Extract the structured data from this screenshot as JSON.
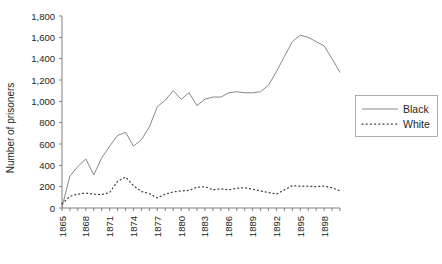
{
  "chart_data": {
    "type": "line",
    "title": "",
    "xlabel": "",
    "ylabel": "Number of prisoners",
    "ylim": [
      0,
      1800
    ],
    "ytick_step": 200,
    "ytick_labels": [
      "1,800",
      "1,600",
      "1,400",
      "1,200",
      "1,000",
      "800",
      "600",
      "400",
      "200",
      "0"
    ],
    "xlim": [
      1865,
      1900
    ],
    "xtick_labels": [
      "1865",
      "1868",
      "1871",
      "1874",
      "1877",
      "1880",
      "1883",
      "1886",
      "1889",
      "1892",
      "1895",
      "1898"
    ],
    "xtick_step": 3,
    "grid": false,
    "legend_position": "right-middle",
    "x": [
      1865,
      1866,
      1867,
      1868,
      1869,
      1870,
      1871,
      1872,
      1873,
      1874,
      1875,
      1876,
      1877,
      1878,
      1879,
      1880,
      1881,
      1882,
      1883,
      1884,
      1885,
      1886,
      1887,
      1888,
      1889,
      1890,
      1891,
      1892,
      1893,
      1894,
      1895,
      1896,
      1897,
      1898,
      1899,
      1900
    ],
    "series": [
      {
        "name": "Black",
        "style": "solid",
        "values": [
          10,
          300,
          390,
          460,
          310,
          470,
          580,
          680,
          710,
          580,
          640,
          760,
          950,
          1010,
          1100,
          1020,
          1080,
          960,
          1020,
          1040,
          1040,
          1080,
          1090,
          1080,
          1080,
          1090,
          1150,
          1280,
          1420,
          1560,
          1620,
          1600,
          1560,
          1520,
          1400,
          1270
        ]
      },
      {
        "name": "White",
        "style": "dotted",
        "values": [
          40,
          110,
          130,
          140,
          130,
          125,
          145,
          250,
          290,
          210,
          155,
          135,
          95,
          130,
          150,
          160,
          165,
          195,
          200,
          170,
          180,
          170,
          185,
          190,
          175,
          160,
          145,
          130,
          170,
          210,
          205,
          205,
          200,
          205,
          190,
          160
        ]
      }
    ]
  },
  "legend": {
    "entries": [
      {
        "label": "Black",
        "style": "solid"
      },
      {
        "label": "White",
        "style": "dotted"
      }
    ]
  }
}
